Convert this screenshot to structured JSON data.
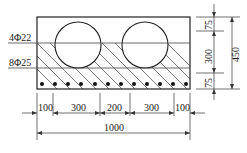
{
  "figure": {
    "type": "beam-cross-section",
    "colors": {
      "line": "#222222",
      "background": "#ffffff"
    }
  },
  "labels": {
    "top_rebar": "4Φ22",
    "bottom_rebar": "8Φ25"
  },
  "dimensions": {
    "vertical": {
      "top_cover": "75",
      "middle": "300",
      "bottom_cover": "75",
      "total": "450"
    },
    "horizontal": {
      "segments": [
        "100",
        "300",
        "200",
        "300",
        "100"
      ],
      "total": "1000"
    }
  },
  "features": {
    "voids": 2,
    "bottom_bar_dots": 12
  }
}
